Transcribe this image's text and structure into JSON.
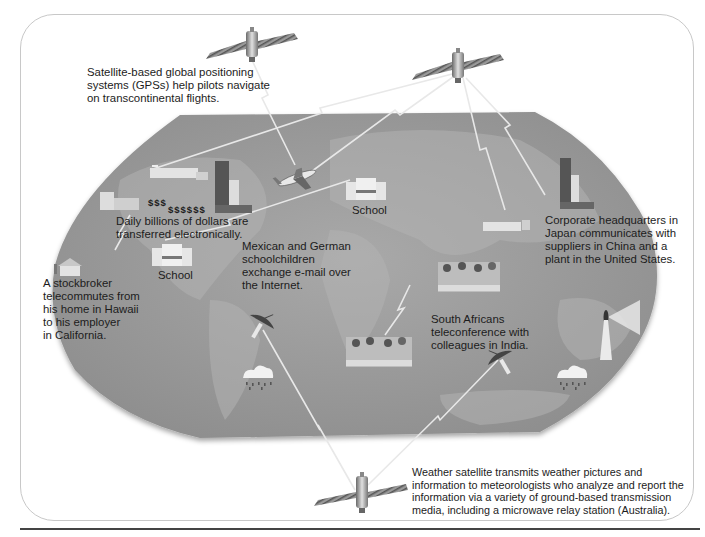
{
  "diagram": {
    "type": "illustration",
    "colors": {
      "map_fill": "#9a9a9a",
      "map_land": "#a8a8a8",
      "link_line": "#e6e6e6",
      "frame_border": "#c8c8c8",
      "text": "#1c1c1c"
    },
    "captions": {
      "gps": [
        "Satellite-based global positioning",
        "systems (GPSs) help pilots navigate",
        "on transcontinental flights."
      ],
      "money": [
        "Daily billions of dollars are",
        "transferred electronically."
      ],
      "stockbroker": [
        "A stockbroker",
        "telecommutes from",
        "his home in Hawaii",
        "to his employer",
        "in California."
      ],
      "schoolchildren": [
        "Mexican and German",
        "schoolchildren",
        "exchange e-mail over",
        "the Internet."
      ],
      "corporate": [
        "Corporate headquarters in",
        "Japan communicates with",
        "suppliers in China and a",
        "plant in the United States."
      ],
      "teleconference": [
        "South Africans",
        "teleconference with",
        "colleagues in India."
      ],
      "weather": [
        "Weather satellite transmits weather pictures and",
        "information to meteorologists who analyze and report the",
        "information via a variety of ground-based transmission",
        "media, including a microwave relay station (Australia)."
      ]
    },
    "school_labels": [
      "School",
      "School"
    ],
    "dollar_signs": [
      "$$$",
      "$$$$$$"
    ],
    "icons": [
      "satellite-icon",
      "satellite-icon",
      "satellite-icon",
      "airplane-icon",
      "school-building-icon",
      "office-tower-icon",
      "factory-icon",
      "house-icon",
      "meeting-table-icon",
      "satellite-dish-icon",
      "rain-cloud-icon",
      "microwave-relay-icon"
    ]
  }
}
